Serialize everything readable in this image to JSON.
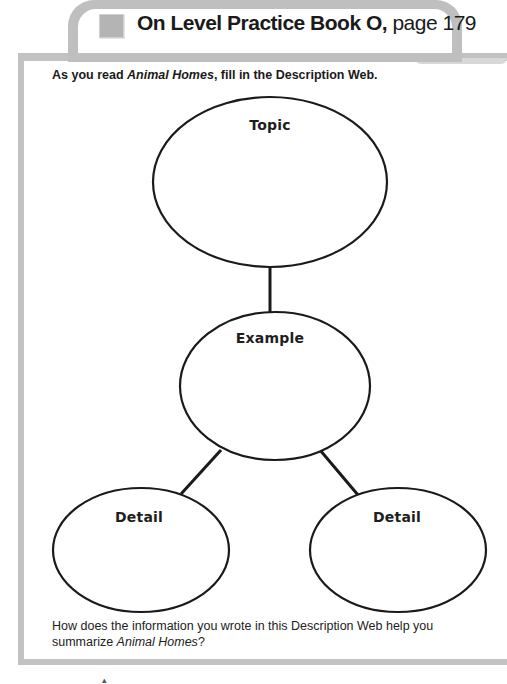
{
  "header": {
    "title_bold": "On Level Practice Book O,",
    "title_page": " page 179"
  },
  "instruction": {
    "prefix": "As you read ",
    "book": "Animal Homes",
    "suffix": ", fill in the Description Web."
  },
  "web": {
    "topic": "Topic",
    "example": "Example",
    "detail_left": "Detail",
    "detail_right": "Detail"
  },
  "question": {
    "prefix": "How does the information you wrote in this Description Web help you summarize ",
    "book": "Animal Homes",
    "suffix": "?"
  },
  "colors": {
    "frame": "#c2c2c2",
    "ink": "#1a1a1a"
  }
}
